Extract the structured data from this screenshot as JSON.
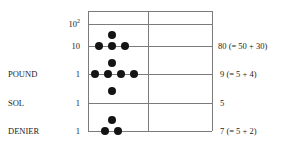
{
  "diagram": {
    "type": "counting-board-abacus",
    "title": "",
    "colors": {
      "line": "#7b7b7b",
      "counter": "#141414",
      "text": "#1d1d1d",
      "background": "#ffffff"
    },
    "rows": [
      {
        "id": "hundreds",
        "denomination": "",
        "place_value": "10",
        "place_exponent": "2",
        "value_note": "",
        "line_counters": 0,
        "space_counters_above": 0
      },
      {
        "id": "tens",
        "denomination": "",
        "place_value": "10",
        "place_exponent": "",
        "value_note": "80 (= 50 + 30)",
        "line_counters": 3,
        "space_counters_above": 1
      },
      {
        "id": "pound",
        "denomination": "POUND",
        "place_value": "1",
        "place_exponent": "",
        "value_note": "9 (= 5 + 4)",
        "line_counters": 4,
        "space_counters_above": 1
      },
      {
        "id": "sol",
        "denomination": "SOL",
        "place_value": "1",
        "place_exponent": "",
        "value_note": "5",
        "line_counters": 0,
        "space_counters_above": 1
      },
      {
        "id": "denier",
        "denomination": "DENIER",
        "place_value": "1",
        "place_exponent": "",
        "value_note": "7 (= 5 + 2)",
        "line_counters": 2,
        "space_counters_above": 1
      }
    ],
    "labels": {
      "power_hundreds_base": "10",
      "power_hundreds_exp": "2",
      "power_tens": "10",
      "unit_pound": "1",
      "unit_sol": "1",
      "unit_denier": "1",
      "denom_pound": "POUND",
      "denom_sol": "SOL",
      "denom_denier": "DENIER",
      "value_tens": "80 (= 50 + 30)",
      "value_pound": "9 (= 5 + 4)",
      "value_sol": "5",
      "value_denier": "7 (= 5 + 2)"
    }
  }
}
